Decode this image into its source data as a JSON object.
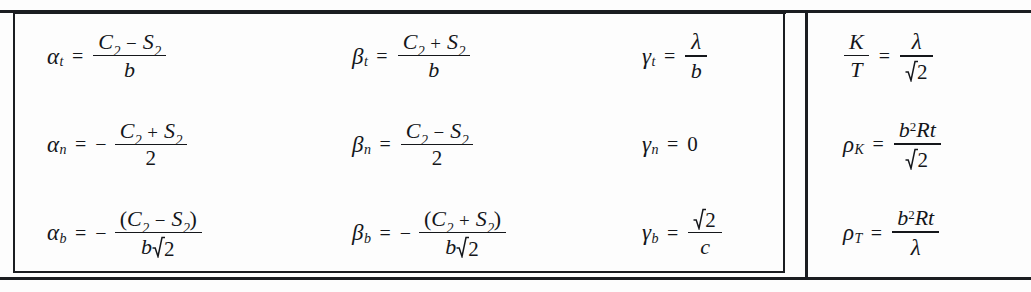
{
  "document": {
    "type": "mathematical-formula-table",
    "rows": 3,
    "columns": 4,
    "ink_color": "#1b1d21",
    "background_color": "#fdfdfd"
  },
  "formulas": {
    "r1c1": {
      "lhs": "α",
      "lhs_sub": "t",
      "numerator": "C₂ − S₂",
      "denominator": "b",
      "plain": "α_t = (C₂ − S₂)/b"
    },
    "r1c2": {
      "lhs": "β",
      "lhs_sub": "t",
      "numerator": "C₂ + S₂",
      "denominator": "b",
      "plain": "β_t = (C₂ + S₂)/b"
    },
    "r1c3": {
      "lhs": "γ",
      "lhs_sub": "t",
      "numerator": "λ",
      "denominator": "b",
      "plain": "γ_t = λ/b"
    },
    "r1c4": {
      "lhs_num": "K",
      "lhs_den": "T",
      "numerator": "λ",
      "denominator": "√2",
      "plain": "K/T = λ/√2"
    },
    "r2c1": {
      "lhs": "α",
      "lhs_sub": "n",
      "sign": "−",
      "numerator": "C₂ + S₂",
      "denominator": "2",
      "plain": "α_n = − (C₂ + S₂)/2"
    },
    "r2c2": {
      "lhs": "β",
      "lhs_sub": "n",
      "numerator": "C₂ − S₂",
      "denominator": "2",
      "plain": "β_n = (C₂ − S₂)/2"
    },
    "r2c3": {
      "lhs": "γ",
      "lhs_sub": "n",
      "value": "0",
      "plain": "γ_n = 0"
    },
    "r2c4": {
      "lhs": "ρ",
      "lhs_sub": "K",
      "numerator": "b²Rt",
      "denominator": "√2",
      "plain": "ρ_K = b²Rt/√2"
    },
    "r3c1": {
      "lhs": "α",
      "lhs_sub": "b",
      "sign": "−",
      "numerator": "(C₂ − S₂)",
      "denominator": "b√2",
      "plain": "α_b = − (C₂ − S₂)/(b√2)"
    },
    "r3c2": {
      "lhs": "β",
      "lhs_sub": "b",
      "sign": "−",
      "numerator": "(C₂ + S₂)",
      "denominator": "b√2",
      "plain": "β_b = − (C₂ + S₂)/(b√2)"
    },
    "r3c3": {
      "lhs": "γ",
      "lhs_sub": "b",
      "numerator": "√2",
      "denominator": "c",
      "plain": "γ_b = √2/c"
    },
    "r3c4": {
      "lhs": "ρ",
      "lhs_sub": "T",
      "numerator": "b²Rt",
      "denominator": "λ",
      "plain": "ρ_T = b²Rt/λ"
    }
  },
  "symbols": {
    "alpha": "α",
    "beta": "β",
    "gamma": "γ",
    "rho": "ρ",
    "lambda": "λ",
    "equals": "=",
    "minus": "−",
    "plus": "+",
    "C": "C",
    "S": "S",
    "b": "b",
    "c": "c",
    "K": "K",
    "T": "T",
    "R": "R",
    "t": "t",
    "two": "2",
    "zero": "0",
    "sub_two": "2",
    "sup_two": "2",
    "paren_open": "(",
    "paren_close": ")"
  }
}
